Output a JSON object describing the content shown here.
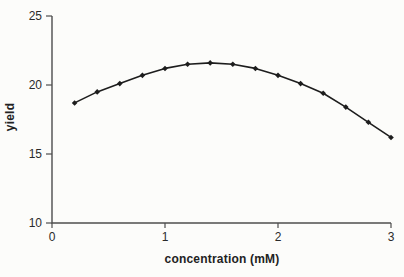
{
  "figure": {
    "background": "#fcfcfa",
    "axis_color": "#4d4d4d",
    "text_color": "#2a2a2a"
  },
  "chart_data": {
    "type": "line",
    "title": "",
    "xlabel": "concentration (mM)",
    "ylabel": "yield",
    "x": [
      0.2,
      0.4,
      0.6,
      0.8,
      1.0,
      1.2,
      1.4,
      1.6,
      1.8,
      2.0,
      2.2,
      2.4,
      2.6,
      2.8,
      3.0
    ],
    "series": [
      {
        "name": "yield",
        "values": [
          18.7,
          19.5,
          20.1,
          20.7,
          21.2,
          21.5,
          21.6,
          21.5,
          21.2,
          20.7,
          20.1,
          19.4,
          18.4,
          17.3,
          16.2
        ],
        "color": "#1d1d1d",
        "marker": "diamond"
      }
    ],
    "xlim": [
      0,
      3
    ],
    "ylim": [
      10,
      25
    ],
    "xticks": [
      0,
      1,
      2,
      3
    ],
    "yticks": [
      10,
      15,
      20,
      25
    ],
    "grid": false,
    "legend": false
  }
}
